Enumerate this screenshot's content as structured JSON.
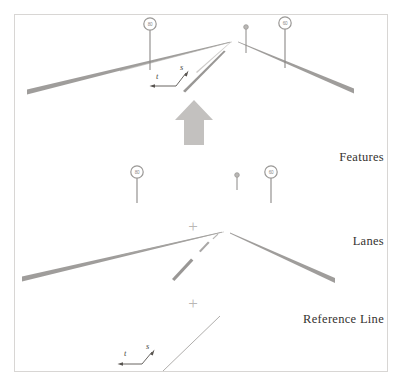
{
  "figure": {
    "background_color": "#ffffff",
    "border_color": "#d8d6d4",
    "border": {
      "x": 14,
      "y": 14,
      "width": 374,
      "height": 358
    }
  },
  "layers": [
    {
      "id": "features",
      "label": "Features",
      "label_x": 384,
      "label_y": 161,
      "description": "Top layer: lane geometry combined with traffic sign features"
    },
    {
      "id": "lanes",
      "label": "Lanes",
      "label_x": 384,
      "label_y": 245,
      "description": "Middle layer: lane boundary and lane marking geometry"
    },
    {
      "id": "reference_line",
      "label": "Reference Line",
      "label_x": 384,
      "label_y": 323,
      "description": "Bottom layer: single reference centerline"
    }
  ],
  "operators": [
    {
      "symbol": "+",
      "x": 193,
      "y": 226,
      "between": "features-and-lanes"
    },
    {
      "symbol": "+",
      "x": 193,
      "y": 303,
      "between": "lanes-and-reference-line"
    }
  ],
  "direction_arrow": {
    "name": "driving-direction-arrow",
    "color": "#c3c1bf",
    "x": 194,
    "y_tip": 100,
    "y_base": 145,
    "points": "194,100 213,120 204,120 204,145 184,145 184,120 175,120"
  },
  "signs": {
    "color_ring": "#9a9896",
    "color_pole": "#8a8886",
    "items": [
      {
        "name": "speed-sign-left-features",
        "value": "80",
        "cx": 150,
        "cy": 24,
        "r": 6.2,
        "pole_bottom": 70,
        "layer": "features",
        "has_plate": true
      },
      {
        "name": "small-marker-features",
        "value": "",
        "cx": 246,
        "cy": 27,
        "r": 2.3,
        "pole_bottom": 53,
        "layer": "features",
        "has_plate": false
      },
      {
        "name": "speed-sign-right-features",
        "value": "60",
        "cx": 285,
        "cy": 23,
        "r": 6.2,
        "pole_bottom": 68,
        "layer": "features",
        "has_plate": true
      },
      {
        "name": "speed-sign-left-lanes",
        "value": "80",
        "cx": 137,
        "cy": 172,
        "r": 6.2,
        "pole_bottom": 203,
        "layer": "features-signs-row2",
        "has_plate": true
      },
      {
        "name": "small-marker-lanes",
        "value": "",
        "cx": 237,
        "cy": 175,
        "r": 2.3,
        "pole_bottom": 190,
        "layer": "features-signs-row2",
        "has_plate": false
      },
      {
        "name": "speed-sign-right-lanes",
        "value": "60",
        "cx": 271,
        "cy": 172,
        "r": 6.2,
        "pole_bottom": 203,
        "layer": "features-signs-row2",
        "has_plate": true
      }
    ]
  },
  "coordinate_frames": [
    {
      "name": "st-frame-features",
      "s_label": "s",
      "t_label": "t",
      "s_label_x": 180,
      "s_label_y": 70,
      "t_label_x": 156,
      "t_label_y": 79,
      "corner_x": 176,
      "corner_y": 86,
      "t_arrow_x": 151,
      "t_arrow_y": 86,
      "s_arrow_x": 187,
      "s_arrow_y": 72,
      "color": "#57534f"
    },
    {
      "name": "st-frame-reference-line",
      "s_label": "s",
      "t_label": "t",
      "s_label_x": 146,
      "s_label_y": 349,
      "t_label_x": 124,
      "t_label_y": 356,
      "corner_x": 142,
      "corner_y": 364,
      "t_arrow_x": 119,
      "t_arrow_y": 364,
      "s_arrow_x": 153,
      "s_arrow_y": 351,
      "color": "#57534f"
    }
  ],
  "geometry": {
    "vanishing_point_features": {
      "x": 230,
      "y": 42
    },
    "vanishing_point_lanes": {
      "x": 222,
      "y": 232
    },
    "lane_line_color_dark": "#8e8c8a",
    "lane_line_color_light": "#b5b3b1",
    "reference_line_color": "#b0aeac",
    "roads": [
      {
        "name": "left-boundary-features",
        "layer": "features",
        "x1": 27,
        "y1": 92,
        "x2": 230,
        "y2": 42,
        "w1": 5.0,
        "w2": 0.5
      },
      {
        "name": "right-boundary-features",
        "layer": "features",
        "x1": 240,
        "y1": 41,
        "x2": 354,
        "y2": 92,
        "w1": 0.5,
        "w2": 5.0
      },
      {
        "name": "center-dash-features",
        "layer": "features",
        "x1": 183,
        "y1": 90,
        "x2": 225,
        "y2": 50,
        "w1": 3.4,
        "w2": 0.6
      },
      {
        "name": "left-boundary-lanes",
        "layer": "lanes",
        "x1": 22,
        "y1": 279,
        "x2": 222,
        "y2": 232,
        "w1": 5.0,
        "w2": 0.5
      },
      {
        "name": "right-boundary-lanes",
        "layer": "lanes",
        "x1": 230,
        "y1": 234,
        "x2": 335,
        "y2": 281,
        "w1": 0.5,
        "w2": 5.0
      },
      {
        "name": "center-dash-lanes-near",
        "layer": "lanes",
        "x1": 173,
        "y1": 278,
        "x2": 192,
        "y2": 259,
        "w1": 3.6,
        "w2": 2.4
      },
      {
        "name": "center-dash-lanes-mid",
        "layer": "lanes",
        "x1": 200,
        "y1": 250,
        "x2": 209,
        "y2": 241,
        "w1": 1.8,
        "w2": 1.2
      },
      {
        "name": "center-dash-lanes-far",
        "layer": "lanes",
        "x1": 213,
        "y1": 238,
        "x2": 218,
        "y2": 234,
        "w1": 0.9,
        "w2": 0.6
      },
      {
        "name": "reference-centerline",
        "layer": "reference_line",
        "x1": 163,
        "y1": 371,
        "x2": 220,
        "y2": 316,
        "w1": 1.0,
        "w2": 0.7
      }
    ]
  }
}
